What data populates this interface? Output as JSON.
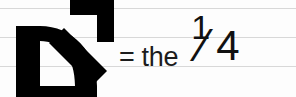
{
  "image": {
    "width": 296,
    "height": 97,
    "background_color": "#fdfdfd",
    "rule_line_color": "#d8d8d8",
    "ink_color": "#111111"
  },
  "glyph": {
    "name": "d-arrow-mars-symbol",
    "description": "bold black D shape with an arrow pointing up and to the right",
    "color": "#000000"
  },
  "equation": {
    "equals_sign": "=",
    "article": "the",
    "fraction": {
      "numerator": "1",
      "slash": "⁄",
      "denominator": "4"
    },
    "noun": "Man",
    "full_text": "= the 1/4 Man"
  },
  "rules": [
    {
      "label": "rule-line-1",
      "y": 8
    },
    {
      "label": "rule-line-2",
      "y": 37
    },
    {
      "label": "rule-line-3",
      "y": 66
    }
  ]
}
